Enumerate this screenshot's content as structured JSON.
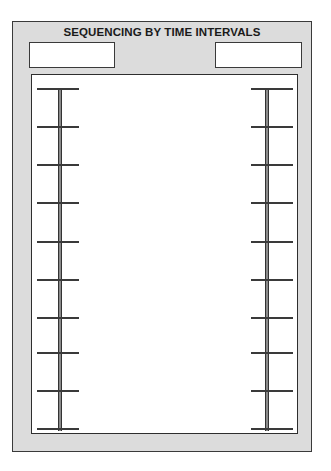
{
  "diagram": {
    "title": "SEQUENCING BY TIME INTERVALS",
    "label_boxes": [
      {
        "position": "left",
        "text": ""
      },
      {
        "position": "right",
        "text": ""
      }
    ],
    "timelines": [
      {
        "side": "left",
        "tick_count": 10
      },
      {
        "side": "right",
        "tick_count": 10
      }
    ],
    "colors": {
      "frame_fill": "#dcdcdc",
      "frame_border": "#3a3a3a",
      "bar_fill": "#8a8a8a",
      "panel_fill": "#ffffff"
    }
  }
}
